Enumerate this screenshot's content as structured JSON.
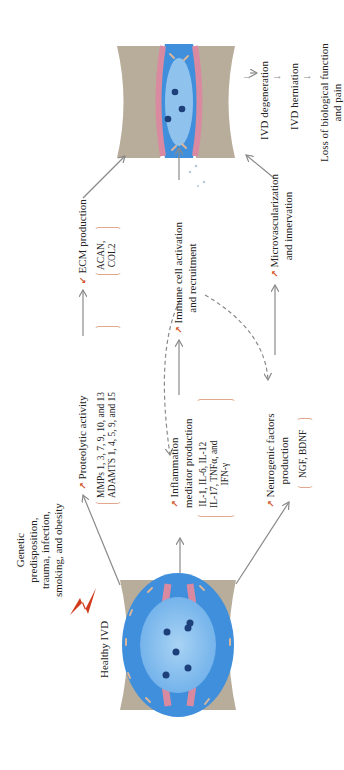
{
  "diagram": {
    "start": {
      "label": "Healthy IVD",
      "risk_factors": [
        "Genetic",
        "predisposition,",
        "trauma, infection,",
        "smoking, and obesity"
      ],
      "risk_icon": "lightning-bolt-icon"
    },
    "pathway_top": {
      "step1": {
        "label": "Proteolytic activity",
        "trend": "increase",
        "details": [
          "MMPs 1, 3, 7, 9, 10, and 13",
          "ADAMTS 1, 4, 5, 9, and 15"
        ]
      },
      "step2": {
        "label": "ECM production",
        "trend": "decrease",
        "details": [
          "ACAN,",
          "COL2"
        ]
      }
    },
    "pathway_middle": {
      "step1": {
        "label_lines": [
          "Inflammation",
          "mediator production"
        ],
        "trend": "increase",
        "details": [
          "IL-1, IL-6, IL-12",
          "IL-17, TNFα, and",
          "IFN-γ"
        ]
      },
      "step2": {
        "label_lines": [
          "Immune cell activation",
          "and recruitment"
        ],
        "trend": "increase"
      }
    },
    "pathway_bottom": {
      "step1": {
        "label_lines": [
          "Neurogenic factors",
          "production"
        ],
        "trend": "increase",
        "details": [
          "NGF, BDNF"
        ]
      },
      "step2": {
        "label_lines": [
          "Microvascularization",
          "and innervation"
        ],
        "trend": "increase"
      }
    },
    "end": {
      "label": "Degenerated IVD",
      "outcomes": [
        "IVD degeneration",
        "IVD herniation",
        "Loss of biological function",
        "and pain"
      ]
    },
    "colors": {
      "arrow": "#8a8a8a",
      "trend_arrow": "#d2542b",
      "bracket": "#e2a68c",
      "bone": "#b8ad9a",
      "annulus": "#d98aa0",
      "disc_outer": "#3f8fdc",
      "disc_inner": "#8fc3ee",
      "lightning": "#d23a1e"
    }
  }
}
